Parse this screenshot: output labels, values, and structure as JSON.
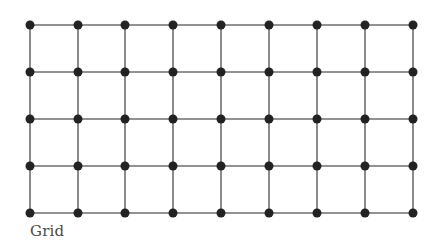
{
  "diagram": {
    "type": "grid-graph",
    "rows": 5,
    "cols": 9,
    "x_positions": [
      30,
      78,
      125,
      173,
      221,
      269,
      317,
      365,
      413
    ],
    "y_positions": [
      25,
      72,
      119,
      166,
      213
    ],
    "node_radius": 4.5,
    "node_color": "#222222",
    "edge_color": "#6e6e6e",
    "edge_width": 1.6
  },
  "caption": "Grid"
}
